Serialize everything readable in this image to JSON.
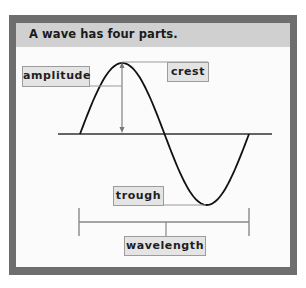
{
  "title": "A wave has four parts.",
  "labels": {
    "amplitude": "amplitude",
    "crest": "crest",
    "trough": "trough",
    "wavelength": "wavelength"
  },
  "colors": {
    "frame": "#6e6e6e",
    "header": "#d0d0d0",
    "label_fill": "#e4e4e4",
    "label_border": "#9c9c9c",
    "wave": "#111111",
    "axis": "#333333",
    "annotation_line": "#777777"
  },
  "wave": {
    "cycles": 1,
    "shape": "sine",
    "parts": [
      "crest",
      "trough",
      "amplitude",
      "wavelength"
    ]
  }
}
